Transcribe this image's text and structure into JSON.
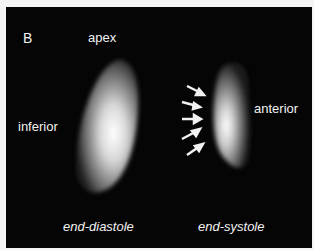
{
  "figure": {
    "panel_label": "B",
    "labels": {
      "apex": "apex",
      "inferior": "inferior",
      "anterior": "anterior",
      "left_caption": "end-diastole",
      "right_caption": "end-systole"
    },
    "arrow_count": 5,
    "colors": {
      "background": "#050505",
      "text": "#f2f2f2",
      "frame": "#f4f4f4"
    }
  }
}
